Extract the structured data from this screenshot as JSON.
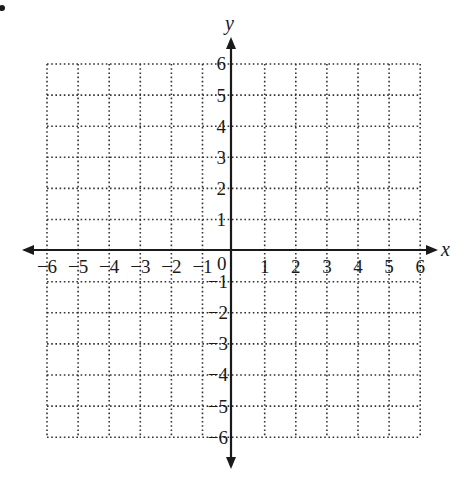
{
  "chart_data": {
    "type": "coordinate-grid",
    "title": "",
    "xlabel": "x",
    "ylabel": "y",
    "xlim": [
      -6,
      6
    ],
    "ylim": [
      -6,
      6
    ],
    "grid": true,
    "grid_style": "dotted",
    "x_ticks": [
      "-6",
      "-5",
      "-4",
      "-3",
      "-2",
      "-1",
      "0",
      "1",
      "2",
      "3",
      "4",
      "5",
      "6"
    ],
    "y_ticks": [
      "-6",
      "-5",
      "-4",
      "-3",
      "-2",
      "-1",
      "1",
      "2",
      "3",
      "4",
      "5",
      "6"
    ],
    "origin_label": "0",
    "series": []
  },
  "labels": {
    "x_axis": "x",
    "y_axis": "y",
    "origin": "0",
    "x_neg": [
      "−6",
      "−5",
      "−4",
      "−3",
      "−2",
      "−1"
    ],
    "x_pos": [
      "1",
      "2",
      "3",
      "4",
      "5",
      "6"
    ],
    "y_pos": [
      "1",
      "2",
      "3",
      "4",
      "5",
      "6"
    ],
    "y_neg": [
      "−1",
      "−2",
      "−3",
      "−4",
      "−5",
      "−6"
    ]
  },
  "colors": {
    "ink": "#1a1a1a",
    "grid": "#333333"
  }
}
